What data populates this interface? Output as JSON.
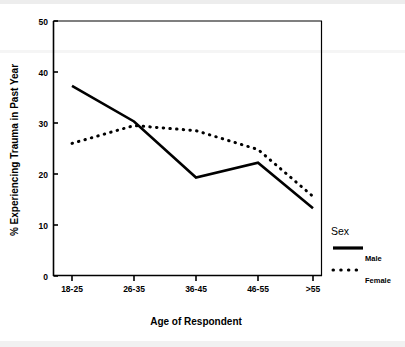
{
  "chart_data": {
    "type": "line",
    "title": "",
    "xlabel": "Age of Respondent",
    "ylabel": "% Experiencing Trauma in Past Year",
    "categories": [
      "18-25",
      "26-35",
      "36-45",
      "46-55",
      ">55"
    ],
    "ylim": [
      0,
      50
    ],
    "yticks": [
      "0",
      "10",
      "20",
      "30",
      "40",
      "50"
    ],
    "ytick_values": [
      0,
      10,
      20,
      30,
      40,
      50
    ],
    "grid": false,
    "legend_position": "right",
    "legend_title": "Sex",
    "series": [
      {
        "name": "Male",
        "style": "solid",
        "color": "#000000",
        "values": [
          37.3,
          30.3,
          19.3,
          22.2,
          13.3
        ]
      },
      {
        "name": "Female",
        "style": "dotted",
        "color": "#000000",
        "values": [
          26.0,
          29.5,
          28.5,
          24.8,
          15.6
        ]
      }
    ]
  },
  "axes": {
    "y_title": "% Experiencing Trauma in Past Year",
    "x_title": "Age of Respondent"
  },
  "legend": {
    "title": "Sex",
    "items": [
      {
        "label": "Male",
        "swatch": "solid-line-swatch"
      },
      {
        "label": "Female",
        "swatch": "dotted-line-swatch"
      }
    ]
  }
}
